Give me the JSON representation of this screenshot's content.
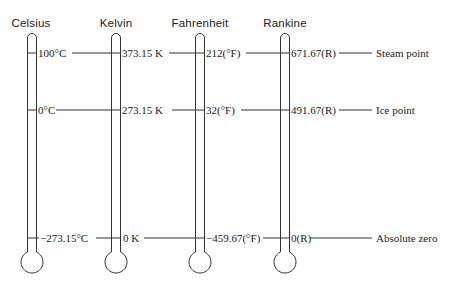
{
  "diagram": {
    "scales": [
      {
        "name": "Celsius",
        "steam": "100°C",
        "ice": "0°C",
        "absolute": "−273.15°C"
      },
      {
        "name": "Kelvin",
        "steam": "373.15 K",
        "ice": "273.15 K",
        "absolute": "0 K"
      },
      {
        "name": "Fahrenheit",
        "steam": "212(°F)",
        "ice": "32(°F)",
        "absolute": "−459.67(°F)"
      },
      {
        "name": "Rankine",
        "steam": "671.67(R)",
        "ice": "491.67(R)",
        "absolute": "0(R)"
      }
    ],
    "reference_points": {
      "steam": "Steam point",
      "ice": "Ice point",
      "absolute": "Absolute zero"
    },
    "line_color": "#333333"
  }
}
